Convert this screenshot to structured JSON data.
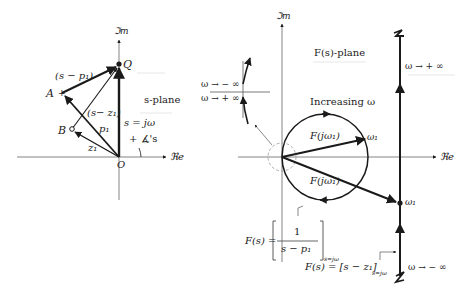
{
  "s_plane": {
    "title": "s-plane",
    "imag_axis": "ℑm",
    "real_axis": "ℜe",
    "origin": "O",
    "points": {
      "Q": "Q",
      "A": "A",
      "B": "B"
    },
    "vector_labels": {
      "s_minus_p1": "(s − p₁)",
      "s_minus_z1": "(s− z₁)",
      "p1": "p₁",
      "z1": "z₁",
      "s_eq": "s = jω",
      "angle": "+ ∡'s"
    }
  },
  "f_plane": {
    "title": "F(s)-plane",
    "imag_axis": "ℑm",
    "real_axis": "ℜe",
    "increasing": "Increasing ω",
    "fjw1_upper": "F(jω₁)",
    "fjw1_lower": "F(jω₁)",
    "omega1_circle": "ω₁",
    "omega1_line": "ω₁",
    "omega_plus_inf": "ω → + ∞",
    "omega_minus_inf": "ω → − ∞",
    "inset_minus_inf": "ω → − ∞",
    "inset_plus_inf": "ω → + ∞",
    "formula_pole_lhs": "F(s) = ",
    "formula_pole_num": "1",
    "formula_pole_den": "s − p₁",
    "formula_pole_sub": "s=jω",
    "formula_zero": "F(s) = [s − z₁]",
    "formula_zero_sub": "s=jω"
  },
  "colors": {
    "ink": "#1a1a1a",
    "light": "#888888",
    "dashed": "#999999"
  }
}
